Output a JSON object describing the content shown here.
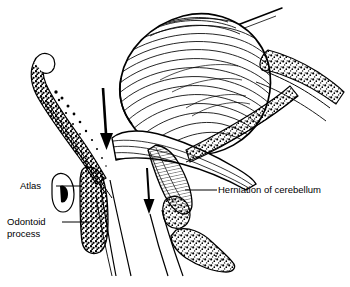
{
  "figure": {
    "kind": "medical-line-drawing",
    "background_color": "#ffffff",
    "ink_color": "#000000"
  },
  "labels": {
    "atlas": "Atlas",
    "odontoid_line1": "Odontoid",
    "odontoid_line2": "process",
    "herniation": "Herniation of cerebellum"
  },
  "annotations": {
    "arrow_large_name": "descent-arrow-brainstem",
    "arrow_small_name": "descent-arrow-tonsil",
    "arrow_count": 2,
    "arrow_direction": "down"
  },
  "structures": [
    {
      "name": "cerebellum",
      "style": "folia-striations"
    },
    {
      "name": "tentorium",
      "style": "straight-line"
    },
    {
      "name": "clivus",
      "style": "stippled-bone"
    },
    {
      "name": "occipital-bone",
      "style": "stippled-bone"
    },
    {
      "name": "atlas-arch",
      "style": "stippled-bone"
    },
    {
      "name": "odontoid-process",
      "style": "stippled-bone"
    },
    {
      "name": "cervical-vertebra",
      "style": "stippled-bone"
    },
    {
      "name": "spinal-cord",
      "style": "outline"
    },
    {
      "name": "herniated-tonsil",
      "style": "hatched"
    }
  ]
}
